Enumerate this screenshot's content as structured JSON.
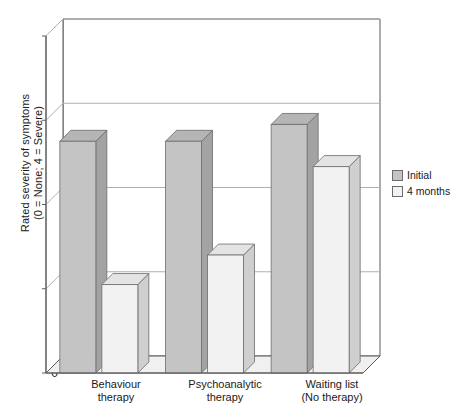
{
  "chart_data": {
    "type": "bar",
    "title": "",
    "subtitle": "",
    "xlabel": "",
    "ylabel": "Rated severity of symptoms\n(0 = None; 4 = Severe)",
    "ylim": [
      0,
      4
    ],
    "yticks": [
      "0",
      "1",
      "2",
      "3",
      "4"
    ],
    "grid": true,
    "three_d": true,
    "legend_position": "right",
    "categories": [
      "Behaviour\ntherapy",
      "Psychoanalytic\ntherapy",
      "Waiting list\n(No therapy)"
    ],
    "series": [
      {
        "name": "Initial",
        "values": [
          2.75,
          2.75,
          2.95
        ],
        "color": "#c4c4c4"
      },
      {
        "name": "4 months",
        "values": [
          1.05,
          1.4,
          2.45
        ],
        "color": "#f2f2f2"
      }
    ],
    "annotations": []
  },
  "legend": {
    "items": [
      {
        "label": "Initial"
      },
      {
        "label": "4 months"
      }
    ]
  },
  "colors": {
    "bar_initial_front": "#c4c4c4",
    "bar_initial_side": "#a3a3a3",
    "bar_initial_top": "#b5b5b5",
    "bar_months_front": "#f2f2f2",
    "bar_months_side": "#cfcfcf",
    "bar_months_top": "#e4e4e4",
    "axis": "#5a5a5a",
    "grid": "#b0b0b0",
    "floor": "#f0f0f0",
    "text": "#1a1a1a"
  }
}
